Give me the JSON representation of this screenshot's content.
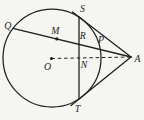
{
  "figure": {
    "background": "#f5f5f2",
    "stroke": "#1f1f1f",
    "labels": {
      "q": "Q",
      "m": "M",
      "s": "S",
      "r": "R",
      "p": "P",
      "o": "O",
      "n": "N",
      "t": "T",
      "a": "A"
    }
  }
}
